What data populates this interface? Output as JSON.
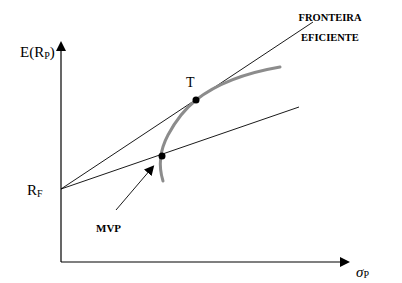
{
  "diagram": {
    "y_axis_label": "E(R",
    "y_axis_label_sub": "P",
    "y_axis_label_close": ")",
    "x_axis_label": "σ",
    "x_axis_label_sub": "P",
    "rf_label": "R",
    "rf_label_sub": "F",
    "tangency_label": "T",
    "frontier_label_line1": "FRONTEIRA",
    "frontier_label_line2": "EFICIENTE",
    "mvp_label": "MVP",
    "colors": {
      "axes": "#000000",
      "lines": "#000000",
      "frontier_curve": "#8c8c8c",
      "points": "#000000",
      "background": "#ffffff"
    }
  }
}
